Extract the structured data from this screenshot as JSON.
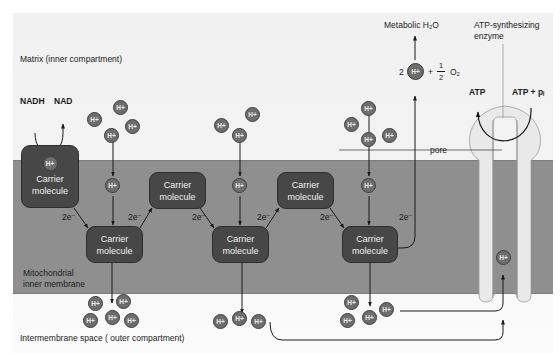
{
  "diagram": {
    "labels": {
      "matrix": "Matrix (inner compartment)",
      "nadh": "NADH",
      "nad": "NAD",
      "inner_membrane_line1": "Mitochondrial",
      "inner_membrane_line2": "inner membrane",
      "intermembrane": "Intermembrane space ( outer compartment)",
      "metabolic_water": "Metabolic H₂O",
      "atp_enzyme_line1": "ATP-synthesizing",
      "atp_enzyme_line2": "enzyme",
      "atp": "ATP",
      "adp_pi": "ATP + pᵢ",
      "pore": "pore",
      "water_eq_coef": "2",
      "water_eq_plus": "+",
      "water_eq_frac_num": "1",
      "water_eq_frac_den": "2",
      "water_eq_o2": "O₂"
    },
    "proton_label": "H+",
    "electron_label": "2e⁻",
    "carriers": [
      {
        "id": "c1",
        "line1": "Carrier",
        "line2": "molecule",
        "has_proton": true
      },
      {
        "id": "c2",
        "line1": "Carrier",
        "line2": "molecule"
      },
      {
        "id": "c3",
        "line1": "Carrier",
        "line2": "molecule"
      },
      {
        "id": "c4",
        "line1": "Carrier",
        "line2": "molecule"
      },
      {
        "id": "c5",
        "line1": "Carrier",
        "line2": "molecule"
      },
      {
        "id": "c6",
        "line1": "Carrier",
        "line2": "molecule"
      }
    ],
    "electron_steps": [
      "2e⁻",
      "2e⁻",
      "2e⁻",
      "2e⁻",
      "2e⁻",
      "2e⁻"
    ],
    "colors": {
      "membrane": "#8f8f8f",
      "carrier": "#474747",
      "proton": "#6d6d6d",
      "background": "#f1f1f1",
      "atp_synthase": "#e8e8e8"
    }
  }
}
